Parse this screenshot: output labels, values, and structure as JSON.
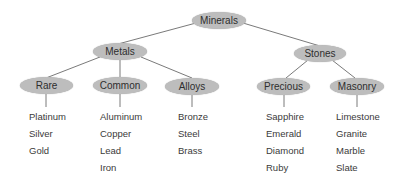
{
  "diagram": {
    "type": "tree",
    "root": {
      "label": "Minerals",
      "children": [
        {
          "label": "Metals",
          "children": [
            {
              "label": "Rare",
              "items": [
                "Platinum",
                "Silver",
                "Gold"
              ]
            },
            {
              "label": "Common",
              "items": [
                "Aluminum",
                "Copper",
                "Lead",
                "Iron"
              ]
            },
            {
              "label": "Alloys",
              "items": [
                "Bronze",
                "Steel",
                "Brass"
              ]
            }
          ]
        },
        {
          "label": "Stones",
          "children": [
            {
              "label": "Precious",
              "items": [
                "Sapphire",
                "Emerald",
                "Diamond",
                "Ruby"
              ]
            },
            {
              "label": "Masonry",
              "items": [
                "Limestone",
                "Granite",
                "Marble",
                "Slate"
              ]
            }
          ]
        }
      ]
    },
    "colors": {
      "node_fill": "#bdbdbd",
      "edge": "#7a7a7a",
      "text": "#2e2e2e"
    }
  }
}
